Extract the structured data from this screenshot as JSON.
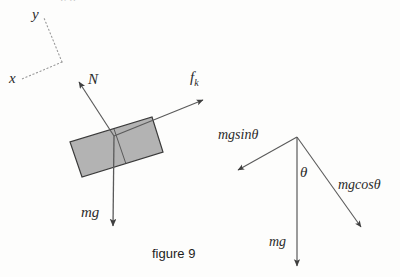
{
  "figure": {
    "caption": "figure 9",
    "clipped_header_text": "y      g",
    "colors": {
      "block_fill": "#b3b3b3",
      "block_stroke": "#3a3a3a",
      "vector_stroke": "#5a5a5a",
      "axis_stroke": "#9a9a9a",
      "label_text": "#2b2b2b",
      "caption_text": "#1d1d1d",
      "background": "#fdfdfc"
    }
  },
  "axes": {
    "y_label": "y",
    "x_label": "x",
    "style": "dotted",
    "corner": {
      "x": 62,
      "y": 62
    },
    "y_end": {
      "x": 44,
      "y": 18
    },
    "x_end": {
      "x": 22,
      "y": 79
    }
  },
  "incline_body": {
    "name": "block-on-incline",
    "corners": [
      {
        "x": 152,
        "y": 117
      },
      {
        "x": 163,
        "y": 152
      },
      {
        "x": 82,
        "y": 177
      },
      {
        "x": 70,
        "y": 142
      }
    ],
    "inner_divider": [
      {
        "x": 114,
        "y": 129
      },
      {
        "x": 126,
        "y": 164
      }
    ],
    "origin": {
      "x": 114,
      "y": 136
    }
  },
  "force_vectors": [
    {
      "label": "N",
      "name": "normal-force-vector",
      "from": {
        "x": 114,
        "y": 136
      },
      "to": {
        "x": 79,
        "y": 82
      },
      "label_pos": {
        "x": 88,
        "y": 72
      }
    },
    {
      "label": "f",
      "label_sub": "k",
      "name": "kinetic-friction-vector",
      "from": {
        "x": 114,
        "y": 136
      },
      "to": {
        "x": 203,
        "y": 100
      },
      "label_pos": {
        "x": 190,
        "y": 70
      }
    },
    {
      "label": "mg",
      "name": "weight-vector",
      "from": {
        "x": 114,
        "y": 136
      },
      "to": {
        "x": 113,
        "y": 226
      },
      "label_pos": {
        "x": 81,
        "y": 205
      }
    }
  ],
  "component_diagram": {
    "apex": {
      "x": 297,
      "y": 137
    },
    "angle_label": "θ",
    "angle_label_pos": {
      "x": 300,
      "y": 165
    },
    "vectors": [
      {
        "label": "mgsinθ",
        "name": "mg-sin-theta-vector",
        "from": {
          "x": 297,
          "y": 137
        },
        "to": {
          "x": 238,
          "y": 170
        },
        "label_pos": {
          "x": 218,
          "y": 128
        }
      },
      {
        "label": "mg",
        "name": "mg-weight-vector",
        "from": {
          "x": 297,
          "y": 137
        },
        "to": {
          "x": 297,
          "y": 266
        },
        "label_pos": {
          "x": 269,
          "y": 235
        }
      },
      {
        "label": "mgcosθ",
        "name": "mg-cos-theta-vector",
        "from": {
          "x": 297,
          "y": 137
        },
        "to": {
          "x": 361,
          "y": 227
        },
        "label_pos": {
          "x": 338,
          "y": 178
        }
      }
    ]
  }
}
